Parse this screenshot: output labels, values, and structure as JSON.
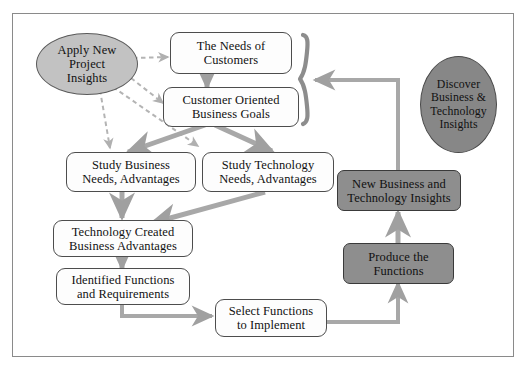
{
  "diagram": {
    "colors": {
      "arrow_gray": "#a0a0a0",
      "dashed_gray": "#b4b4b4",
      "box_fill": "#fdfdfd",
      "shaded_fill": "#8e8e8e",
      "ellipse_light": "#c2c2c2",
      "ellipse_dark": "#878787",
      "frame_border": "#8a8a8a",
      "text": "#111111"
    },
    "nodes": [
      {
        "id": "apply-new-project-insights",
        "shape": "ellipse",
        "fill": "light",
        "lines": [
          "Apply New",
          "Project",
          "Insights"
        ]
      },
      {
        "id": "the-needs-of-customers",
        "shape": "rounded-box",
        "fill": "white",
        "lines": [
          "The Needs of",
          "Customers"
        ]
      },
      {
        "id": "customer-oriented-business-goals",
        "shape": "rounded-box",
        "fill": "white",
        "lines": [
          "Customer Oriented",
          "Business Goals"
        ]
      },
      {
        "id": "study-business-needs-advantages",
        "shape": "rounded-box",
        "fill": "white",
        "lines": [
          "Study Business",
          "Needs, Advantages"
        ]
      },
      {
        "id": "study-technology-needs-advantages",
        "shape": "rounded-box",
        "fill": "white",
        "lines": [
          "Study Technology",
          "Needs, Advantages"
        ]
      },
      {
        "id": "technology-created-business-advantages",
        "shape": "rounded-box",
        "fill": "white",
        "lines": [
          "Technology Created",
          "Business Advantages"
        ]
      },
      {
        "id": "identified-functions-and-requirements",
        "shape": "rounded-box",
        "fill": "white",
        "lines": [
          "Identified Functions",
          "and Requirements"
        ]
      },
      {
        "id": "select-functions-to-implement",
        "shape": "rounded-box",
        "fill": "white",
        "lines": [
          "Select Functions",
          "to Implement"
        ]
      },
      {
        "id": "produce-the-functions",
        "shape": "rounded-box",
        "fill": "shaded",
        "lines": [
          "Produce the",
          "Functions"
        ]
      },
      {
        "id": "new-business-and-technology-insights",
        "shape": "rounded-box",
        "fill": "shaded",
        "lines": [
          "New Business and",
          "Technology Insights"
        ]
      },
      {
        "id": "discover-business-technology-insights",
        "shape": "ellipse",
        "fill": "dark",
        "lines": [
          "Discover",
          "Business &",
          "Technology",
          "Insights"
        ]
      }
    ],
    "labels": {
      "apply_l1": "Apply New",
      "apply_l2": "Project",
      "apply_l3": "Insights",
      "needs_l1": "The Needs of",
      "needs_l2": "Customers",
      "goals_l1": "Customer Oriented",
      "goals_l2": "Business Goals",
      "study_business_l1": "Study Business",
      "study_business_l2": "Needs, Advantages",
      "study_tech_l1": "Study Technology",
      "study_tech_l2": "Needs, Advantages",
      "tech_created_l1": "Technology Created",
      "tech_created_l2": "Business Advantages",
      "identified_l1": "Identified Functions",
      "identified_l2": "and Requirements",
      "select_l1": "Select Functions",
      "select_l2": "to Implement",
      "produce_l1": "Produce the",
      "produce_l2": "Functions",
      "new_insights_l1": "New Business and",
      "new_insights_l2": "Technology Insights",
      "discover_l1": "Discover",
      "discover_l2": "Business &",
      "discover_l3": "Technology",
      "discover_l4": "Insights"
    },
    "edges": [
      {
        "id": "apply-to-needs",
        "style": "dashed",
        "from": "apply-new-project-insights",
        "to": "the-needs-of-customers"
      },
      {
        "id": "apply-to-goals",
        "style": "dashed",
        "from": "apply-new-project-insights",
        "to": "customer-oriented-business-goals"
      },
      {
        "id": "apply-to-study-business",
        "style": "dashed",
        "from": "apply-new-project-insights",
        "to": "study-business-needs-advantages"
      },
      {
        "id": "apply-to-study-technology",
        "style": "dashed",
        "from": "apply-new-project-insights",
        "to": "study-technology-needs-advantages"
      },
      {
        "id": "needs-to-goals",
        "style": "solid",
        "from": "the-needs-of-customers",
        "to": "customer-oriented-business-goals"
      },
      {
        "id": "goals-to-study-business",
        "style": "solid",
        "from": "customer-oriented-business-goals",
        "to": "study-business-needs-advantages"
      },
      {
        "id": "goals-to-study-technology",
        "style": "solid",
        "from": "customer-oriented-business-goals",
        "to": "study-technology-needs-advantages"
      },
      {
        "id": "study-business-to-technology-created",
        "style": "solid",
        "from": "study-business-needs-advantages",
        "to": "technology-created-business-advantages"
      },
      {
        "id": "study-technology-to-technology-created",
        "style": "solid",
        "from": "study-technology-needs-advantages",
        "to": "technology-created-business-advantages"
      },
      {
        "id": "technology-created-to-identified",
        "style": "solid",
        "from": "technology-created-business-advantages",
        "to": "identified-functions-and-requirements"
      },
      {
        "id": "identified-to-select",
        "style": "solid",
        "from": "identified-functions-and-requirements",
        "to": "select-functions-to-implement"
      },
      {
        "id": "select-to-produce",
        "style": "solid",
        "from": "select-functions-to-implement",
        "to": "produce-the-functions"
      },
      {
        "id": "produce-to-new-insights",
        "style": "solid",
        "from": "produce-the-functions",
        "to": "new-business-and-technology-insights"
      },
      {
        "id": "new-insights-to-brace",
        "style": "solid",
        "from": "new-business-and-technology-insights",
        "to": "top-group-brace"
      }
    ],
    "decorations": [
      {
        "id": "top-group-brace",
        "type": "curly-brace",
        "groups": [
          "the-needs-of-customers",
          "customer-oriented-business-goals"
        ]
      }
    ]
  }
}
